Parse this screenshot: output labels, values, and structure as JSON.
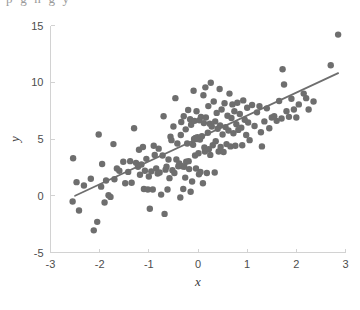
{
  "figure": {
    "background_color": "#ffffff",
    "cropped_caption_fragment": "p   g   n   g   y",
    "axes_color": "#d2d2d2",
    "label_color": "#4d4d4d"
  },
  "chart_data": {
    "type": "scatter",
    "title": "",
    "xlabel": "x",
    "ylabel": "y",
    "xlim": [
      -3,
      3
    ],
    "ylim": [
      -5,
      15
    ],
    "xticks": [
      -3,
      -2,
      -1,
      0,
      1,
      2,
      3
    ],
    "yticks": [
      -5,
      0,
      5,
      10,
      15
    ],
    "xticklabels": [
      "-3",
      "-2",
      "-1",
      "0",
      "1",
      "2",
      "3"
    ],
    "yticklabels": [
      "-5",
      "0",
      "5",
      "10",
      "15"
    ],
    "grid": false,
    "legend": false,
    "marker_color": "#6e6e6e",
    "marker_size": 3.2,
    "series": [
      {
        "name": "observations",
        "type": "scatter",
        "color": "#6e6e6e",
        "points": [
          [
            -2.55,
            -0.5
          ],
          [
            -2.54,
            3.3
          ],
          [
            -2.47,
            1.2
          ],
          [
            -2.42,
            -1.3
          ],
          [
            -2.32,
            0.9
          ],
          [
            -2.18,
            1.5
          ],
          [
            -2.12,
            -3.05
          ],
          [
            -2.05,
            -2.3
          ],
          [
            -2.02,
            5.4
          ],
          [
            -1.97,
            0.8
          ],
          [
            -1.95,
            2.8
          ],
          [
            -1.9,
            -0.6
          ],
          [
            -1.87,
            1.35
          ],
          [
            -1.82,
            0.05
          ],
          [
            -1.78,
            -0.1
          ],
          [
            -1.72,
            4.55
          ],
          [
            -1.7,
            1.45
          ],
          [
            -1.65,
            2.4
          ],
          [
            -1.6,
            2.2
          ],
          [
            -1.52,
            3.0
          ],
          [
            -1.48,
            1.1
          ],
          [
            -1.42,
            2.1
          ],
          [
            -1.38,
            3.05
          ],
          [
            -1.35,
            1.15
          ],
          [
            -1.3,
            5.95
          ],
          [
            -1.26,
            2.9
          ],
          [
            -1.22,
            2.55
          ],
          [
            -1.2,
            4.05
          ],
          [
            -1.18,
            1.85
          ],
          [
            -1.15,
            2.75
          ],
          [
            -1.12,
            4.3
          ],
          [
            -1.1,
            0.6
          ],
          [
            -1.08,
            2.2
          ],
          [
            -1.05,
            3.25
          ],
          [
            -1.02,
            0.55
          ],
          [
            -1.0,
            1.7
          ],
          [
            -0.98,
            -1.15
          ],
          [
            -0.95,
            2.15
          ],
          [
            -0.92,
            0.55
          ],
          [
            -0.9,
            4.4
          ],
          [
            -0.88,
            3.6
          ],
          [
            -0.85,
            2.4
          ],
          [
            -0.82,
            1.95
          ],
          [
            -0.8,
            4.15
          ],
          [
            -0.78,
            2.05
          ],
          [
            -0.75,
            0.1
          ],
          [
            -0.72,
            3.55
          ],
          [
            -0.7,
            7.0
          ],
          [
            -0.68,
            -1.6
          ],
          [
            -0.66,
            2.3
          ],
          [
            -0.64,
            2.55
          ],
          [
            -0.62,
            0.55
          ],
          [
            -0.6,
            3.2
          ],
          [
            -0.58,
            1.55
          ],
          [
            -0.56,
            5.2
          ],
          [
            -0.54,
            4.9
          ],
          [
            -0.52,
            2.25
          ],
          [
            -0.5,
            6.1
          ],
          [
            -0.48,
            2.0
          ],
          [
            -0.46,
            8.6
          ],
          [
            -0.44,
            3.2
          ],
          [
            -0.42,
            4.6
          ],
          [
            -0.4,
            2.6
          ],
          [
            -0.38,
            2.85
          ],
          [
            -0.36,
            -0.15
          ],
          [
            -0.35,
            5.35
          ],
          [
            -0.34,
            6.5
          ],
          [
            -0.32,
            2.6
          ],
          [
            -0.3,
            0.6
          ],
          [
            -0.29,
            7.0
          ],
          [
            -0.28,
            2.55
          ],
          [
            -0.26,
            1.6
          ],
          [
            -0.25,
            5.85
          ],
          [
            -0.24,
            3.0
          ],
          [
            -0.22,
            4.6
          ],
          [
            -0.2,
            7.55
          ],
          [
            -0.19,
            3.05
          ],
          [
            -0.18,
            2.35
          ],
          [
            -0.16,
            6.75
          ],
          [
            -0.15,
            0.35
          ],
          [
            -0.14,
            6.25
          ],
          [
            -0.12,
            1.25
          ],
          [
            -0.1,
            4.5
          ],
          [
            -0.09,
            9.25
          ],
          [
            -0.08,
            5.0
          ],
          [
            -0.07,
            6.6
          ],
          [
            -0.06,
            3.55
          ],
          [
            -0.05,
            5.1
          ],
          [
            -0.04,
            2.4
          ],
          [
            -0.03,
            7.45
          ],
          [
            -0.02,
            5.0
          ],
          [
            -0.01,
            5.15
          ],
          [
            0.0,
            5.05
          ],
          [
            0.01,
            3.75
          ],
          [
            0.02,
            1.9
          ],
          [
            0.03,
            6.65
          ],
          [
            0.04,
            4.95
          ],
          [
            0.05,
            2.1
          ],
          [
            0.06,
            6.95
          ],
          [
            0.08,
            5.25
          ],
          [
            0.1,
            1.1
          ],
          [
            0.11,
            8.85
          ],
          [
            0.12,
            6.4
          ],
          [
            0.13,
            4.25
          ],
          [
            0.14,
            3.9
          ],
          [
            0.15,
            9.55
          ],
          [
            0.16,
            6.9
          ],
          [
            0.18,
            2.0
          ],
          [
            0.2,
            5.55
          ],
          [
            0.21,
            7.9
          ],
          [
            0.22,
            4.1
          ],
          [
            0.24,
            6.35
          ],
          [
            0.25,
            3.6
          ],
          [
            0.26,
            9.95
          ],
          [
            0.28,
            6.1
          ],
          [
            0.3,
            4.45
          ],
          [
            0.32,
            8.3
          ],
          [
            0.34,
            2.05
          ],
          [
            0.35,
            6.55
          ],
          [
            0.36,
            4.8
          ],
          [
            0.38,
            7.3
          ],
          [
            0.4,
            5.9
          ],
          [
            0.42,
            3.9
          ],
          [
            0.44,
            9.4
          ],
          [
            0.45,
            6.2
          ],
          [
            0.46,
            4.3
          ],
          [
            0.48,
            7.6
          ],
          [
            0.5,
            5.4
          ],
          [
            0.52,
            3.85
          ],
          [
            0.54,
            8.15
          ],
          [
            0.56,
            6.05
          ],
          [
            0.58,
            4.55
          ],
          [
            0.6,
            7.05
          ],
          [
            0.62,
            5.75
          ],
          [
            0.64,
            9.0
          ],
          [
            0.66,
            4.35
          ],
          [
            0.68,
            6.85
          ],
          [
            0.7,
            8.05
          ],
          [
            0.72,
            5.5
          ],
          [
            0.74,
            7.45
          ],
          [
            0.76,
            4.4
          ],
          [
            0.78,
            6.3
          ],
          [
            0.8,
            8.2
          ],
          [
            0.82,
            5.8
          ],
          [
            0.85,
            7.2
          ],
          [
            0.88,
            6.0
          ],
          [
            0.9,
            4.45
          ],
          [
            0.92,
            8.4
          ],
          [
            0.95,
            6.7
          ],
          [
            0.98,
            5.35
          ],
          [
            1.0,
            7.75
          ],
          [
            1.02,
            6.45
          ],
          [
            1.05,
            4.9
          ],
          [
            1.1,
            8.0
          ],
          [
            1.15,
            6.15
          ],
          [
            1.2,
            7.35
          ],
          [
            1.25,
            7.9
          ],
          [
            1.28,
            5.6
          ],
          [
            1.3,
            4.35
          ],
          [
            1.35,
            6.55
          ],
          [
            1.4,
            7.7
          ],
          [
            1.45,
            5.95
          ],
          [
            1.5,
            6.9
          ],
          [
            1.55,
            7.0
          ],
          [
            1.6,
            6.6
          ],
          [
            1.65,
            8.35
          ],
          [
            1.7,
            6.8
          ],
          [
            1.72,
            11.15
          ],
          [
            1.75,
            9.8
          ],
          [
            1.8,
            7.45
          ],
          [
            1.85,
            6.95
          ],
          [
            1.9,
            8.55
          ],
          [
            1.95,
            7.6
          ],
          [
            2.0,
            6.9
          ],
          [
            2.05,
            8.05
          ],
          [
            2.15,
            9.0
          ],
          [
            2.2,
            8.6
          ],
          [
            2.25,
            7.6
          ],
          [
            2.35,
            8.3
          ],
          [
            2.7,
            11.5
          ],
          [
            2.85,
            14.2
          ]
        ]
      },
      {
        "name": "fitted-line",
        "type": "line",
        "color": "#6e6e6e",
        "x": [
          -2.5,
          2.85
        ],
        "y": [
          0.0,
          10.8
        ],
        "slope": 2.02,
        "intercept": 5.05
      }
    ]
  }
}
